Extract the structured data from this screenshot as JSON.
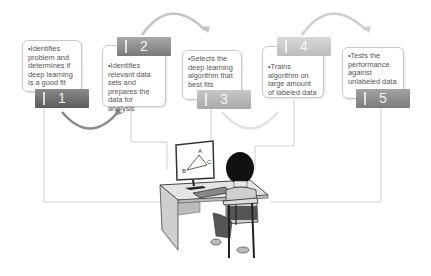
{
  "diagram": {
    "steps": [
      {
        "number": "1",
        "text": "•Identifies problem and determines if deep learning is a good fit",
        "tab_color": "#6e6e6e"
      },
      {
        "number": "2",
        "text": "•Identifies relevant data sets and prepares the data for analysis",
        "tab_color": "#8e8e8e"
      },
      {
        "number": "3",
        "text": "•Selects the deep learning algorithm that best fits",
        "tab_color": "#b8b8b8"
      },
      {
        "number": "4",
        "text": "•Trains algorithm on large amount of labeled data",
        "tab_color": "#cacaca"
      },
      {
        "number": "5",
        "text": "•Tests the performance against unlabeled data",
        "tab_color": "#909090"
      }
    ],
    "monitor_labels": {
      "a": "A",
      "b": "B",
      "c": "C"
    },
    "illustration": "person-at-computer-desk"
  }
}
